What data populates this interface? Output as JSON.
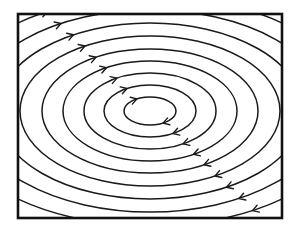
{
  "diagram": {
    "type": "concentric-elliptical-streamlines",
    "flow_direction": "clockwise",
    "colors": {
      "background": "#ffffff",
      "stroke": "#1a1a1a",
      "frame": "#111111"
    },
    "frame": {
      "x": 18,
      "y": 14,
      "width": 264,
      "height": 204,
      "stroke_width": 2.6
    },
    "center": {
      "x": 150,
      "y": 111
    },
    "ellipses": [
      {
        "rx": 26,
        "ry": 14
      },
      {
        "rx": 46,
        "ry": 26
      },
      {
        "rx": 66,
        "ry": 38
      },
      {
        "rx": 87,
        "ry": 50
      },
      {
        "rx": 108,
        "ry": 62
      },
      {
        "rx": 130,
        "ry": 75
      },
      {
        "rx": 153,
        "ry": 88
      },
      {
        "rx": 178,
        "ry": 101
      },
      {
        "rx": 205,
        "ry": 115
      },
      {
        "rx": 235,
        "ry": 130
      }
    ],
    "arrow_angle_upper_left_deg": 240,
    "arrow_angle_lower_right_deg": 60,
    "arrow_count_per_side": 10
  }
}
